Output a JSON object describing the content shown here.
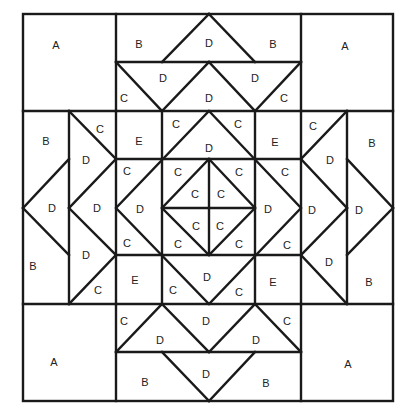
{
  "diagram": {
    "colors": {
      "line": "#1a1a1a",
      "background": "#ffffff",
      "text": "#222222"
    },
    "labels": [
      {
        "t": "A",
        "x": 56,
        "y": 45
      },
      {
        "t": "B",
        "x": 139,
        "y": 44
      },
      {
        "t": "D",
        "x": 209,
        "y": 43
      },
      {
        "t": "B",
        "x": 273,
        "y": 44
      },
      {
        "t": "A",
        "x": 345,
        "y": 46
      },
      {
        "t": "D",
        "x": 163,
        "y": 78
      },
      {
        "t": "D",
        "x": 255,
        "y": 78
      },
      {
        "t": "C",
        "x": 124,
        "y": 98
      },
      {
        "t": "D",
        "x": 209,
        "y": 98
      },
      {
        "t": "C",
        "x": 284,
        "y": 98
      },
      {
        "t": "B",
        "x": 46,
        "y": 141
      },
      {
        "t": "C",
        "x": 100,
        "y": 129
      },
      {
        "t": "E",
        "x": 139,
        "y": 141
      },
      {
        "t": "C",
        "x": 176,
        "y": 124
      },
      {
        "t": "C",
        "x": 238,
        "y": 124
      },
      {
        "t": "E",
        "x": 275,
        "y": 142
      },
      {
        "t": "C",
        "x": 313,
        "y": 126
      },
      {
        "t": "B",
        "x": 372,
        "y": 143
      },
      {
        "t": "D",
        "x": 209,
        "y": 148
      },
      {
        "t": "D",
        "x": 86,
        "y": 160
      },
      {
        "t": "C",
        "x": 127,
        "y": 171
      },
      {
        "t": "C",
        "x": 178,
        "y": 172
      },
      {
        "t": "C",
        "x": 239,
        "y": 172
      },
      {
        "t": "C",
        "x": 285,
        "y": 172
      },
      {
        "t": "D",
        "x": 330,
        "y": 160
      },
      {
        "t": "C",
        "x": 195,
        "y": 194
      },
      {
        "t": "C",
        "x": 221,
        "y": 194
      },
      {
        "t": "D",
        "x": 52,
        "y": 208
      },
      {
        "t": "D",
        "x": 97,
        "y": 208
      },
      {
        "t": "D",
        "x": 140,
        "y": 209
      },
      {
        "t": "D",
        "x": 268,
        "y": 209
      },
      {
        "t": "D",
        "x": 312,
        "y": 210
      },
      {
        "t": "D",
        "x": 359,
        "y": 210
      },
      {
        "t": "C",
        "x": 196,
        "y": 226
      },
      {
        "t": "C",
        "x": 220,
        "y": 226
      },
      {
        "t": "C",
        "x": 127,
        "y": 243
      },
      {
        "t": "C",
        "x": 178,
        "y": 244
      },
      {
        "t": "C",
        "x": 239,
        "y": 244
      },
      {
        "t": "C",
        "x": 287,
        "y": 245
      },
      {
        "t": "D",
        "x": 86,
        "y": 255
      },
      {
        "t": "D",
        "x": 329,
        "y": 262
      },
      {
        "t": "B",
        "x": 33,
        "y": 266
      },
      {
        "t": "E",
        "x": 135,
        "y": 280
      },
      {
        "t": "D",
        "x": 207,
        "y": 277
      },
      {
        "t": "E",
        "x": 273,
        "y": 282
      },
      {
        "t": "B",
        "x": 369,
        "y": 282
      },
      {
        "t": "C",
        "x": 98,
        "y": 290
      },
      {
        "t": "C",
        "x": 173,
        "y": 290
      },
      {
        "t": "C",
        "x": 239,
        "y": 292
      },
      {
        "t": "C",
        "x": 124,
        "y": 321
      },
      {
        "t": "D",
        "x": 206,
        "y": 321
      },
      {
        "t": "C",
        "x": 287,
        "y": 321
      },
      {
        "t": "D",
        "x": 160,
        "y": 340
      },
      {
        "t": "D",
        "x": 256,
        "y": 340
      },
      {
        "t": "A",
        "x": 54,
        "y": 362
      },
      {
        "t": "A",
        "x": 348,
        "y": 364
      },
      {
        "t": "D",
        "x": 206,
        "y": 374
      },
      {
        "t": "B",
        "x": 145,
        "y": 382
      },
      {
        "t": "B",
        "x": 266,
        "y": 383
      }
    ]
  }
}
